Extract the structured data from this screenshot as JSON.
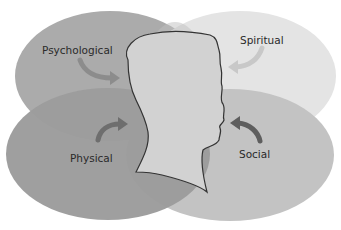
{
  "diagram": {
    "type": "overlapping-ellipses-with-head",
    "center": {
      "shape": "head-silhouette-profile-facing-right"
    },
    "regions": [
      {
        "id": "psychological",
        "label": "Psychological",
        "position": "top-left",
        "color": "#a9a9a9"
      },
      {
        "id": "spiritual",
        "label": "Spiritual",
        "position": "top-right",
        "color": "#e3e3e3"
      },
      {
        "id": "physical",
        "label": "Physical",
        "position": "bottom-left",
        "color": "#9a9a9a"
      },
      {
        "id": "social",
        "label": "Social",
        "position": "bottom-right",
        "color": "#c2c2c2"
      }
    ],
    "arrows": [
      {
        "from": "psychological",
        "to": "head",
        "color": "#8c8c8c"
      },
      {
        "from": "spiritual",
        "to": "head",
        "color": "#c8c8c8"
      },
      {
        "from": "physical",
        "to": "head",
        "color": "#6e6e6e"
      },
      {
        "from": "social",
        "to": "head",
        "color": "#5e5e5e"
      }
    ],
    "head_color": "#cfcfcf",
    "outline_color": "#333333"
  }
}
